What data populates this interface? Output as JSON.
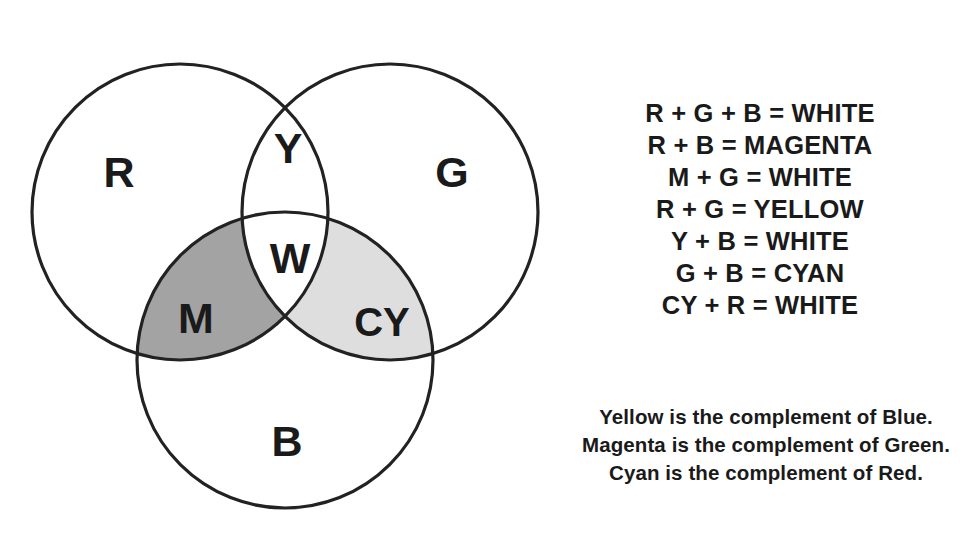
{
  "diagram": {
    "stroke_color": "#222222",
    "background_color": "#ffffff",
    "stroke_width": 3,
    "circles": [
      {
        "name": "red-circle",
        "label": "R",
        "cx": 180,
        "cy": 212,
        "r": 148,
        "fill": "#ffffff"
      },
      {
        "name": "green-circle",
        "label": "G",
        "cx": 390,
        "cy": 212,
        "r": 148,
        "fill": "#ffffff"
      },
      {
        "name": "blue-circle",
        "label": "B",
        "cx": 285,
        "cy": 360,
        "r": 148,
        "fill": "#ffffff"
      }
    ],
    "regions": [
      {
        "name": "red-only",
        "label": "R",
        "fill": "#ffffff"
      },
      {
        "name": "green-only",
        "label": "G",
        "fill": "#ffffff"
      },
      {
        "name": "blue-only",
        "label": "B",
        "fill": "#ffffff"
      },
      {
        "name": "yellow-region",
        "label": "Y",
        "fill": "#ffffff"
      },
      {
        "name": "white-center",
        "label": "W",
        "fill": "#ffffff"
      },
      {
        "name": "magenta-region",
        "label": "M",
        "fill": "#a3a3a3"
      },
      {
        "name": "cyan-region",
        "label": "CY",
        "fill": "#dedede"
      }
    ],
    "labels": {
      "red": "R",
      "green": "G",
      "blue": "B",
      "yellow": "Y",
      "white": "W",
      "magenta": "M",
      "cyan": "CY"
    }
  },
  "equations": [
    "R + G + B = WHITE",
    "R + B = MAGENTA",
    "M + G = WHITE",
    "R + G = YELLOW",
    "Y + B = WHITE",
    "G + B = CYAN",
    "CY + R = WHITE"
  ],
  "complements": [
    "Yellow is the complement of Blue.",
    "Magenta is the complement of Green.",
    "Cyan is the complement of Red."
  ]
}
